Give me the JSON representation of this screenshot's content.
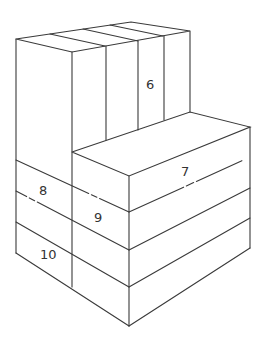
{
  "diagram": {
    "labels": [
      {
        "id": "6",
        "text": "6",
        "x": 152,
        "y": 88
      },
      {
        "id": "7",
        "text": "7",
        "x": 186,
        "y": 175
      },
      {
        "id": "8",
        "text": "8",
        "x": 43,
        "y": 194
      },
      {
        "id": "9",
        "text": "9",
        "x": 99,
        "y": 222
      },
      {
        "id": "10",
        "text": "10",
        "x": 47,
        "y": 259
      }
    ],
    "colors": {
      "line": "#3a3a3a",
      "label": "#333333",
      "background": "#ffffff"
    }
  }
}
